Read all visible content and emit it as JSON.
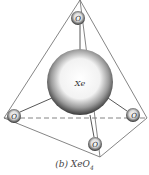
{
  "diagram": {
    "central_atom": "Xe",
    "ligand_label": "O",
    "caption_prefix": "(b) ",
    "caption_formula": "XeO",
    "caption_subscript": "4",
    "atoms": [
      {
        "id": "Xe",
        "label": "Xe",
        "x": 80,
        "y": 82,
        "r": 33
      },
      {
        "id": "O_top",
        "label": "O",
        "x": 78,
        "y": 18,
        "r": 7
      },
      {
        "id": "O_left",
        "label": "O",
        "x": 14,
        "y": 116,
        "r": 7
      },
      {
        "id": "O_right",
        "label": "O",
        "x": 133,
        "y": 115,
        "r": 7
      },
      {
        "id": "O_bottom",
        "label": "O",
        "x": 95,
        "y": 144,
        "r": 7
      }
    ],
    "colors": {
      "line": "#555555",
      "sphere_dark": "#3a3a3a",
      "sphere_light": "#ffffff"
    }
  }
}
